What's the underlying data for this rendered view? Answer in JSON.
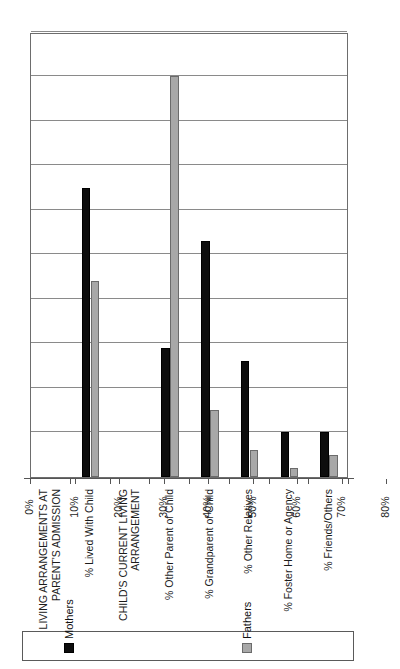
{
  "chart_data": {
    "type": "bar",
    "title": "",
    "subtitle": "",
    "xlabel": "",
    "ylabel": "",
    "orientation": "vertical",
    "grid": true,
    "legend_position": "right",
    "ylim": [
      0,
      100
    ],
    "ytick_labels": [
      "0%",
      "10%",
      "20%",
      "30%",
      "40%",
      "50%",
      "60%",
      "70%",
      "80%",
      "90%",
      "100%"
    ],
    "ytick_values": [
      0,
      10,
      20,
      30,
      40,
      50,
      60,
      70,
      80,
      90,
      100
    ],
    "categories": [
      "LIVING ARRANGEMENTS AT\nPARENT'S ADMISSION",
      "% Lived With Child",
      "CHILD'S CURRENT LIVING\nARRANGEMENT",
      "% Other Parent of Child",
      "% Grandparent of Child",
      "% Other Relatives",
      "% Foster Home or Agency",
      "% Friends/Others"
    ],
    "category_is_header": [
      true,
      false,
      true,
      false,
      false,
      false,
      false,
      false
    ],
    "series": [
      {
        "name": "Mothers",
        "color": "#0d0d0d",
        "values": [
          null,
          65,
          null,
          29,
          53,
          26,
          10,
          10
        ]
      },
      {
        "name": "Fathers",
        "color": "#a8a8a8",
        "values": [
          null,
          44,
          null,
          90,
          15,
          6,
          2,
          5
        ]
      }
    ]
  },
  "legend": {
    "entries": [
      {
        "label": "Mothers",
        "swatch": "mothers"
      },
      {
        "label": "Fathers",
        "swatch": "fathers"
      }
    ]
  }
}
